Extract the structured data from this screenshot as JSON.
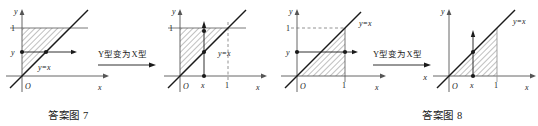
{
  "figures": [
    {
      "id": "figure-7",
      "caption": "答案图 7",
      "transform_label": "Y型变为X型",
      "transform_arrow_sublabel": "",
      "panels": [
        {
          "id": "f7-left",
          "type": "Y-type",
          "axis_x_label": "x",
          "axis_y_label": "y",
          "origin_label": "O",
          "y_ticks": [
            "1",
            "y"
          ],
          "x_ticks": [],
          "line_label": "y=x",
          "region_description": "triangle bounded by y=x, y=1, x=0",
          "arrow_direction": "horizontal-right",
          "dashed_guides": []
        },
        {
          "id": "f7-right",
          "type": "X-type",
          "axis_x_label": "x",
          "axis_y_label": "y",
          "origin_label": "O",
          "y_ticks": [
            "1"
          ],
          "x_ticks": [
            "x",
            "1"
          ],
          "line_label": "y=x",
          "region_description": "triangle bounded by y=x, y=1, x=0",
          "arrow_direction": "vertical-up",
          "dashed_guides": [
            "x=1"
          ]
        }
      ]
    },
    {
      "id": "figure-8",
      "caption": "答案图 8",
      "transform_label": "Y型变为X型",
      "transform_arrow_sublabel": "x",
      "panels": [
        {
          "id": "f8-left",
          "type": "Y-type",
          "axis_x_label": "x",
          "axis_y_label": "y",
          "origin_label": "O",
          "y_ticks": [
            "1",
            "y"
          ],
          "x_ticks": [
            "1"
          ],
          "line_label": "y=x",
          "region_description": "triangle bounded by y=x, x=1, y=0",
          "arrow_direction": "horizontal-right",
          "dashed_guides": [
            "y=1"
          ]
        },
        {
          "id": "f8-right",
          "type": "X-type",
          "axis_x_label": "x",
          "axis_y_label": "y",
          "origin_label": "O",
          "y_ticks": [],
          "x_ticks": [
            "x",
            "1"
          ],
          "line_label": "y=x",
          "region_description": "triangle bounded by y=x, x=1, y=0",
          "arrow_direction": "vertical-up",
          "dashed_guides": []
        }
      ]
    }
  ],
  "colors": {
    "ink": "#1a1a1a",
    "axis": "#555555",
    "hatch": "#4a4a4a",
    "dashed": "#777777",
    "background": "#ffffff"
  }
}
